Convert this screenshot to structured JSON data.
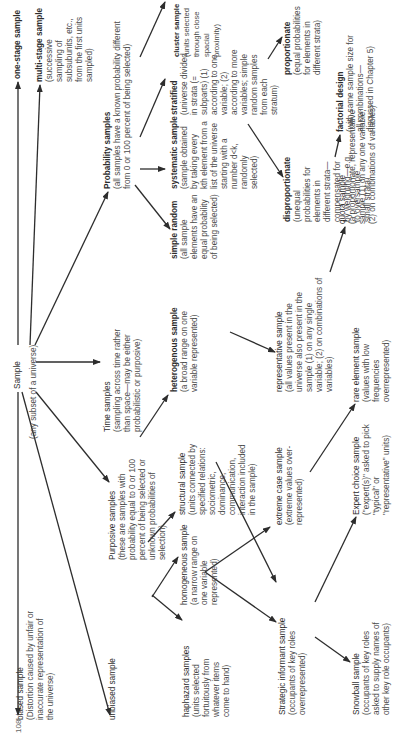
{
  "page_number": "108",
  "nodes": {
    "sample": {
      "title": "Sample",
      "desc": "(any subset of a universe)"
    },
    "biased": {
      "title": "biased sample",
      "desc": "(Distortion caused by unfair or inaccurate representation of the universe)"
    },
    "unbiased": {
      "title": "unbiased sample",
      "desc": ""
    },
    "one_stage": {
      "title": "one-stage sample",
      "desc": ""
    },
    "multi_stage": {
      "title": "multi-stage sample",
      "desc": "(successive sampling of subsubunits, etc., from the first units sampled)"
    },
    "probability": {
      "title": "Probability samples",
      "desc": "(all samples have a known probability different from 0 or 100 percent of being selected)"
    },
    "time": {
      "title": "Time samples",
      "desc": "(sampling across time rather than space—may be either probabilistic or purposive)"
    },
    "purposive": {
      "title": "Purposive samples",
      "desc": "(these are samples with probability equal to 0 or 100 percent of being selected or unknown probabilities of selection)"
    },
    "simple_random": {
      "title": "simple random",
      "desc": "(all sample elements have an equal probability of being selected)"
    },
    "systematic": {
      "title": "systematic sample",
      "desc": "(sample obtained by taking every kth element from a list of the universe starting with a number d<k, randomly selected)"
    },
    "stratified": {
      "title": "stratified",
      "desc": "(universe divided in strata (= subparts) (1) according to one variable; (2) according to more variables; simple random samples from each stratum)"
    },
    "cluster": {
      "title": "cluster sample",
      "desc": "(units selected through close spacial proximity)"
    },
    "proportionate": {
      "title": "proportionate",
      "desc": "(equal probabilities for elements in different strata)"
    },
    "disproportionate": {
      "title": "disproportionate",
      "desc": "(unequal probabilities for elements in different strata—compensated for by weighting—e.g., to oversample small strata)"
    },
    "factorial": {
      "title": "factorial design",
      "desc": "(with same sample size for all combinations—discussed in Chapter 5)"
    },
    "haphazard": {
      "title": "haphazard samples",
      "desc": "(units selected fortuitously from whatever items come to hand)"
    },
    "homogeneous": {
      "title": "homogeneous sample",
      "desc": "(a narrow range on one variable represented)"
    },
    "structural": {
      "title": "structural sample",
      "desc": "(units connected by specified relations: sociometric, dominance, communication, interaction included in the sample)"
    },
    "heterogeneous": {
      "title": "heterogenous sample",
      "desc": "(a broad range on one variable represented)"
    },
    "representative": {
      "title": "representative sample",
      "desc": "(all values present in the universe also present in the sample (1) on any single variable; (2) on combinations of variables)"
    },
    "quota": {
      "title": "quota sample",
      "desc": "(a proportionate, representative sample (1) on any one variable; (2) on combinations of variables)"
    },
    "extreme_case": {
      "title": "extreme case sample",
      "desc": "(extreme values over-represented)"
    },
    "rare_element": {
      "title": "rare element sample",
      "desc": "(values with low frequencies overrepresented)"
    },
    "strategic_informant": {
      "title": "Strategic informant sample",
      "desc": "(occupants of key roles overrepresented)"
    },
    "expert_choice": {
      "title": "Expert choice sample",
      "desc": "(\"expert(s)\" asked to pick \"typical\" or \"representative\" units)"
    },
    "snowball": {
      "title": "Snowball sample",
      "desc": "(occupants of key roles asked to supply names of other key role occupants)"
    }
  },
  "colors": {
    "ink": "#2d2d2d",
    "paper": "#ffffff"
  }
}
